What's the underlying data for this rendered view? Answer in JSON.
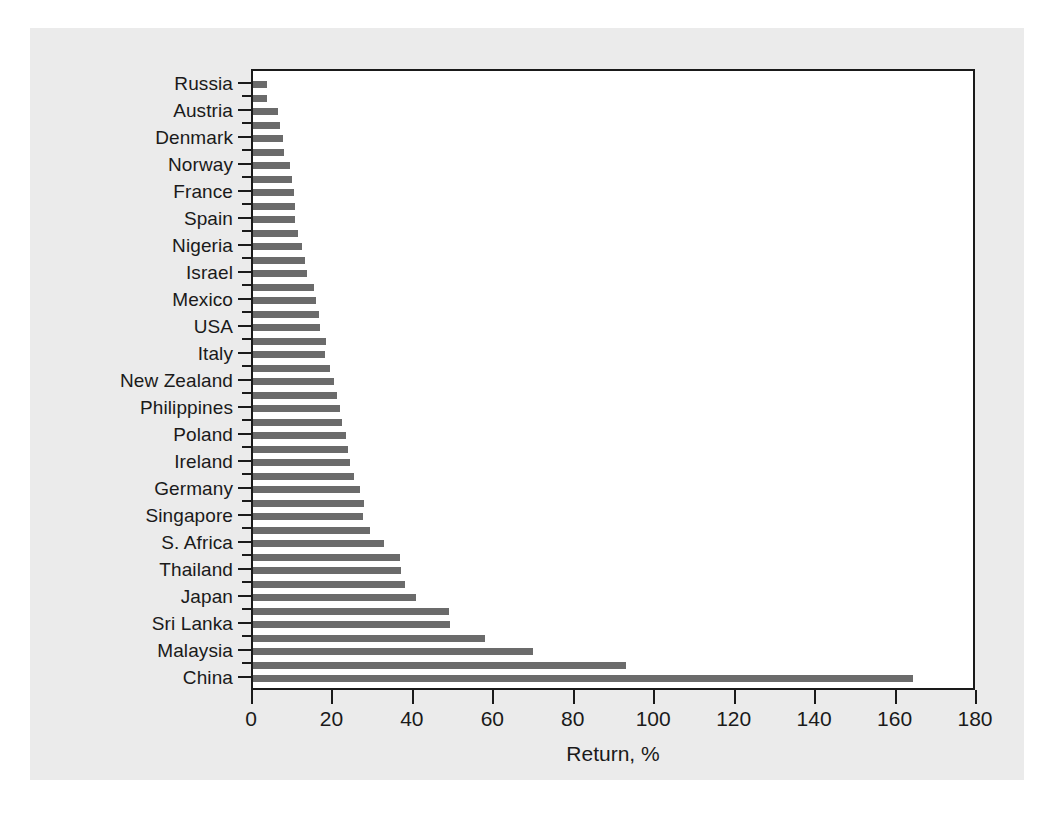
{
  "chart_data": {
    "type": "bar",
    "orientation": "horizontal",
    "title": "",
    "xlabel": "Return, %",
    "ylabel": "",
    "xlim": [
      0,
      180
    ],
    "xticks": [
      0,
      20,
      40,
      60,
      80,
      100,
      120,
      140,
      160,
      180
    ],
    "grid": false,
    "legend": null,
    "bar_color": "#6b6b6b",
    "axis_color": "#1a1a1a",
    "panel_color": "#ebebeb",
    "plot_background": "#ffffff",
    "note": "Labels are shown for every other bar; unlabelled bars lie between labelled ones.",
    "categories": [
      "Russia",
      "",
      "Austria",
      "",
      "Denmark",
      "",
      "Norway",
      "",
      "France",
      "",
      "Spain",
      "",
      "Nigeria",
      "",
      "Israel",
      "",
      "Mexico",
      "",
      "USA",
      "",
      "Italy",
      "",
      "New Zealand",
      "",
      "Philippines",
      "",
      "Poland",
      "",
      "Ireland",
      "",
      "Germany",
      "",
      "Singapore",
      "",
      "S. Africa",
      "",
      "Thailand",
      "",
      "Japan",
      "",
      "Sri Lanka",
      "",
      "Malaysia",
      "",
      "China"
    ],
    "values": [
      3.6,
      3.6,
      6.1,
      6.6,
      7.4,
      7.6,
      9.3,
      9.7,
      10.1,
      10.4,
      10.4,
      11.2,
      12.2,
      12.9,
      13.4,
      15.2,
      15.6,
      16.4,
      16.6,
      18.1,
      17.8,
      19.2,
      20.1,
      20.9,
      21.6,
      22.2,
      23.2,
      23.6,
      24.2,
      25.1,
      26.5,
      27.5,
      27.4,
      29.0,
      32.5,
      36.6,
      36.9,
      37.7,
      40.6,
      48.7,
      49.1,
      57.7,
      69.6,
      92.7,
      164.0
    ],
    "labelled_points": [
      {
        "label": "Russia",
        "value": 3.6
      },
      {
        "label": "Austria",
        "value": 6.1
      },
      {
        "label": "Denmark",
        "value": 7.4
      },
      {
        "label": "Norway",
        "value": 9.3
      },
      {
        "label": "France",
        "value": 10.1
      },
      {
        "label": "Spain",
        "value": 10.4
      },
      {
        "label": "Nigeria",
        "value": 12.2
      },
      {
        "label": "Israel",
        "value": 13.4
      },
      {
        "label": "Mexico",
        "value": 15.6
      },
      {
        "label": "USA",
        "value": 16.6
      },
      {
        "label": "Italy",
        "value": 17.8
      },
      {
        "label": "New Zealand",
        "value": 20.1
      },
      {
        "label": "Philippines",
        "value": 21.6
      },
      {
        "label": "Poland",
        "value": 23.2
      },
      {
        "label": "Ireland",
        "value": 24.2
      },
      {
        "label": "Germany",
        "value": 26.5
      },
      {
        "label": "Singapore",
        "value": 27.4
      },
      {
        "label": "S. Africa",
        "value": 32.5
      },
      {
        "label": "Thailand",
        "value": 36.9
      },
      {
        "label": "Japan",
        "value": 40.6
      },
      {
        "label": "Sri Lanka",
        "value": 49.1
      },
      {
        "label": "Malaysia",
        "value": 69.6
      },
      {
        "label": "China",
        "value": 164.0
      }
    ]
  }
}
